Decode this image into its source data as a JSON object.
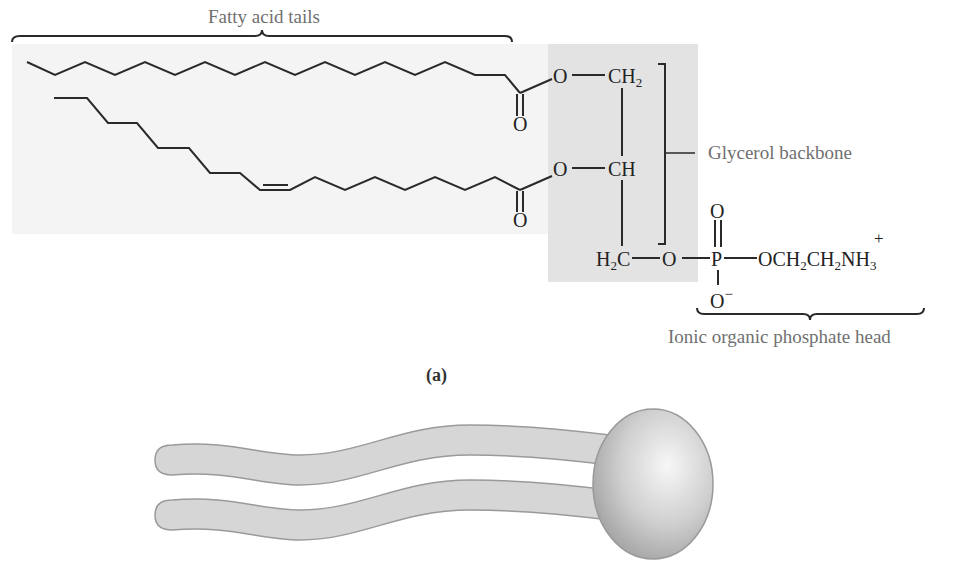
{
  "figure": {
    "panel_label": "(a)",
    "labels": {
      "fatty_acid_tails": "Fatty acid tails",
      "glycerol_backbone": "Glycerol backbone",
      "phosphate_head": "Ionic organic phosphate head"
    },
    "atoms": {
      "ester_o_top": "O",
      "carbonyl_o_top": "O",
      "ester_o_bottom": "O",
      "carbonyl_o_bottom": "O",
      "ch2_top": "CH",
      "ch2_top_sub": "2",
      "ch_middle": "CH",
      "h2c_h": "H",
      "h2c_sub": "2",
      "h2c_c": "C",
      "phosphate_ester_o": "O",
      "phosphorus": "P",
      "p_double_o": "O",
      "p_single_o": "O",
      "p_o_charge": "−",
      "ethanolamine_o": "OCH",
      "ethanolamine_sub1": "2",
      "ethanolamine_ch": "CH",
      "ethanolamine_sub2": "2",
      "ethanolamine_n": "NH",
      "ethanolamine_sub3": "3",
      "ammonium_charge": "+"
    },
    "colors": {
      "bond": "#2a2a2a",
      "label": "#707070",
      "glycerol_shade": "#e3e3e3",
      "tail_panel": "#f4f4f4",
      "cartoon_fill": "#d6d6d6",
      "cartoon_stroke": "#9a9a9a"
    },
    "cartoon": {
      "description": "Simplified phospholipid: two wavy hydrophobic tails attached to a spherical polar head"
    }
  }
}
